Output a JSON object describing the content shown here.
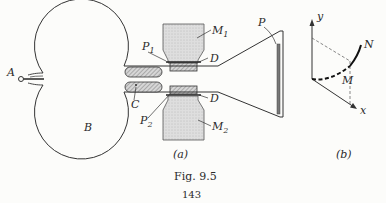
{
  "figure": {
    "caption": "Fig. 9.5",
    "page_number": "143",
    "panel_a": {
      "label": "(a)",
      "labels": {
        "A": "A",
        "B": "B",
        "C": "C",
        "D_top": "D",
        "D_bottom": "D",
        "P": "P",
        "P1": "P",
        "P1_sub": "1",
        "P2": "P",
        "P2_sub": "2",
        "M1": "M",
        "M1_sub": "1",
        "M2": "M",
        "M2_sub": "2"
      }
    },
    "panel_b": {
      "label": "(b)",
      "labels": {
        "y": "y",
        "x": "x",
        "N": "N",
        "M": "M"
      }
    }
  }
}
